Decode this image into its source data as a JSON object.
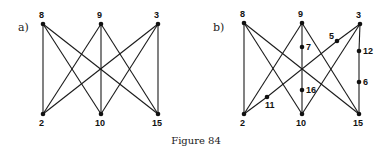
{
  "figure": {
    "caption": "Figure 84",
    "panels": [
      {
        "id": "a",
        "label": "a)",
        "label_pos": [
          18,
          31
        ],
        "nodes": [
          {
            "id": "8",
            "x": 43,
            "y": 24,
            "lx": 39,
            "ly": 18
          },
          {
            "id": "9",
            "x": 101,
            "y": 24,
            "lx": 97,
            "ly": 18
          },
          {
            "id": "3",
            "x": 158,
            "y": 24,
            "lx": 154,
            "ly": 18
          },
          {
            "id": "2",
            "x": 43,
            "y": 114,
            "lx": 39,
            "ly": 126
          },
          {
            "id": "10",
            "x": 101,
            "y": 114,
            "lx": 95,
            "ly": 126
          },
          {
            "id": "15",
            "x": 158,
            "y": 114,
            "lx": 152,
            "ly": 126
          }
        ],
        "edges": [
          [
            "8",
            "2"
          ],
          [
            "8",
            "10"
          ],
          [
            "8",
            "15"
          ],
          [
            "9",
            "2"
          ],
          [
            "9",
            "10"
          ],
          [
            "9",
            "15"
          ],
          [
            "3",
            "2"
          ],
          [
            "3",
            "10"
          ],
          [
            "3",
            "15"
          ]
        ]
      },
      {
        "id": "b",
        "label": "b)",
        "label_pos": [
          213,
          31
        ],
        "nodes": [
          {
            "id": "8",
            "x": 244,
            "y": 23,
            "lx": 240,
            "ly": 17
          },
          {
            "id": "9",
            "x": 302,
            "y": 23,
            "lx": 298,
            "ly": 17
          },
          {
            "id": "3",
            "x": 360,
            "y": 24,
            "lx": 356,
            "ly": 18
          },
          {
            "id": "2",
            "x": 244,
            "y": 114,
            "lx": 240,
            "ly": 126
          },
          {
            "id": "10",
            "x": 302,
            "y": 114,
            "lx": 296,
            "ly": 126
          },
          {
            "id": "15",
            "x": 359,
            "y": 114,
            "lx": 353,
            "ly": 126
          },
          {
            "id": "7",
            "x": 302,
            "y": 47,
            "lx": 306,
            "ly": 50
          },
          {
            "id": "16",
            "x": 302,
            "y": 90,
            "lx": 306,
            "ly": 93
          },
          {
            "id": "12",
            "x": 359,
            "y": 51,
            "lx": 363,
            "ly": 54
          },
          {
            "id": "6",
            "x": 359,
            "y": 82,
            "lx": 363,
            "ly": 85
          },
          {
            "id": "5",
            "x": 337,
            "y": 41,
            "lx": 329,
            "ly": 39
          },
          {
            "id": "11",
            "x": 267,
            "y": 97,
            "lx": 265,
            "ly": 108
          }
        ],
        "edges": [
          [
            "8",
            "2"
          ],
          [
            "8",
            "10"
          ],
          [
            "8",
            "15"
          ],
          [
            "9",
            "2"
          ],
          [
            "9",
            "7"
          ],
          [
            "7",
            "16"
          ],
          [
            "16",
            "10"
          ],
          [
            "9",
            "15"
          ],
          [
            "3",
            "5"
          ],
          [
            "5",
            "11"
          ],
          [
            "11",
            "2"
          ],
          [
            "3",
            "10"
          ],
          [
            "3",
            "12"
          ],
          [
            "12",
            "6"
          ],
          [
            "6",
            "15"
          ]
        ]
      }
    ]
  }
}
